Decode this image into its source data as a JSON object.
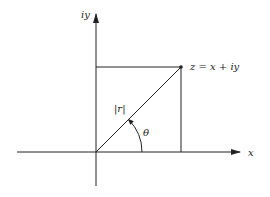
{
  "diagram": {
    "title": "",
    "y_axis_label": "iy",
    "x_axis_label": "x",
    "point_label": "z = x + iy",
    "modulus_label": "|r|",
    "angle_label": "θ",
    "colors": {
      "stroke": "#222222",
      "background": "#ffffff"
    }
  }
}
